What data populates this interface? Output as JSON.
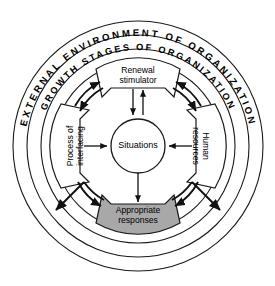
{
  "diagram": {
    "title_outer_ring": "EXTERNAL ENVIRONMENT OF ORGANIZATION",
    "title_inner_ring": "GROWTH STAGES OF ORGANIZATION",
    "center": {
      "label": "Situations"
    },
    "segments": {
      "top": {
        "label_line1": "Renewal",
        "label_line2": "stimulator"
      },
      "left": {
        "label_line1": "Process of",
        "label_line2": "interfacing"
      },
      "right": {
        "label_line1": "Human",
        "label_line2": "resources"
      },
      "bottom": {
        "label_line1": "Appropriate",
        "label_line2": "responses",
        "fill_color": "#a8a8a8"
      }
    },
    "colors": {
      "background": "#ffffff",
      "stroke": "#1a1a1a",
      "shaded_segment": "#a8a8a8",
      "text": "#000000"
    }
  }
}
